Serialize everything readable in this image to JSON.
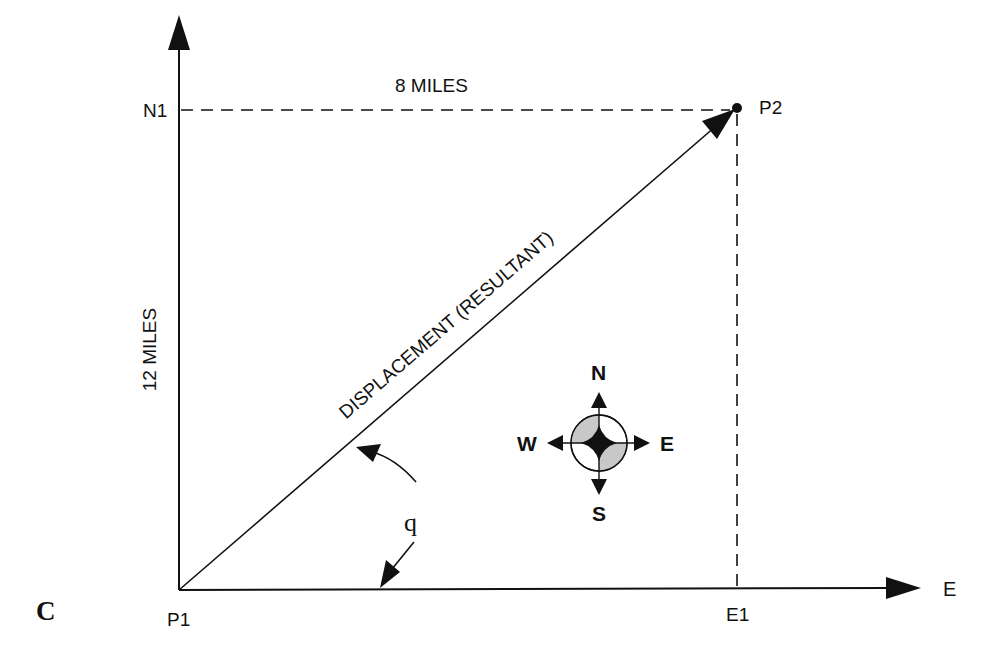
{
  "figure": {
    "panel_label": "C",
    "axes": {
      "north_axis_label": "N1",
      "east_axis_label": "E",
      "origin_label": "P1",
      "east_tick_label": "E1"
    },
    "points": {
      "start": "P1",
      "end": "P2"
    },
    "measurements": {
      "east_distance": "8 MILES",
      "north_distance": "12 MILES"
    },
    "vector_label": "DISPLACEMENT (RESULTANT)",
    "angle_symbol": "q",
    "compass": {
      "north": "N",
      "south": "S",
      "east": "E",
      "west": "W",
      "shade_color": "#c8c8c8"
    },
    "colors": {
      "line": "#111111",
      "background": "#ffffff"
    }
  }
}
